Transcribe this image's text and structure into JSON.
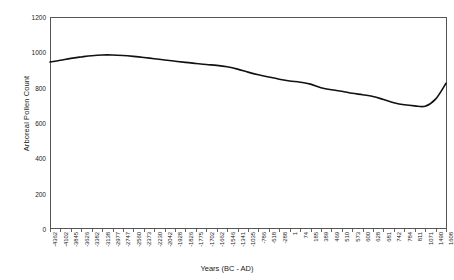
{
  "chart_data": {
    "type": "line",
    "title": "",
    "xlabel": "Years (BC - AD)",
    "ylabel": "Arboreal Pollen Count",
    "ylim": [
      0,
      1200
    ],
    "yticks": [
      0,
      200,
      400,
      600,
      800,
      1000,
      1200
    ],
    "grid": false,
    "legend": null,
    "categories": [
      "-4362",
      "-4102",
      "-3845",
      "-3626",
      "-3382",
      "-3138",
      "-2977",
      "-2747",
      "-2560",
      "-2373",
      "-2230",
      "-2042",
      "-1928",
      "-1826",
      "-1775",
      "-1702",
      "-1662",
      "-1546",
      "-1341",
      "-1035",
      "-786",
      "-518",
      "-288",
      "1",
      "74",
      "185",
      "389",
      "469",
      "510",
      "573",
      "600",
      "628",
      "681",
      "742",
      "784",
      "811",
      "1071",
      "1490",
      "1608"
    ],
    "values": [
      945,
      955,
      966,
      974,
      981,
      985,
      985,
      982,
      977,
      971,
      964,
      957,
      950,
      943,
      937,
      931,
      926,
      918,
      905,
      888,
      873,
      860,
      848,
      838,
      831,
      820,
      800,
      788,
      780,
      768,
      760,
      750,
      733,
      715,
      703,
      697,
      695,
      735,
      825
    ],
    "series": [
      {
        "name": "Arboreal Pollen Count",
        "color": "#111111",
        "values": [
          945,
          955,
          966,
          974,
          981,
          985,
          985,
          982,
          977,
          971,
          964,
          957,
          950,
          943,
          937,
          931,
          926,
          918,
          905,
          888,
          873,
          860,
          848,
          838,
          831,
          820,
          800,
          788,
          780,
          768,
          760,
          750,
          733,
          715,
          703,
          697,
          695,
          735,
          825
        ]
      }
    ],
    "annotations": {
      "peak_value": 985,
      "peak_year": "-3138",
      "minimum_value": 695,
      "minimum_year": "1071",
      "final_value": 825,
      "final_year": "1608",
      "start_value": 945,
      "start_year": "-4362"
    },
    "style": {
      "line_color": "#111111",
      "line_width": 1.6,
      "axis_color": "#555555",
      "background": "#ffffff"
    }
  }
}
